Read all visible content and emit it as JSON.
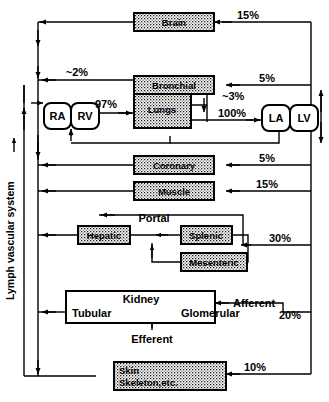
{
  "figure": {
    "type": "diagram",
    "side_axis_label": "Lymph vascular system"
  },
  "chambers": [
    {
      "id": "ra",
      "label": "RA",
      "name": "right-atrium"
    },
    {
      "id": "rv",
      "label": "RV",
      "name": "right-ventricle"
    },
    {
      "id": "la",
      "label": "LA",
      "name": "left-atrium"
    },
    {
      "id": "lv",
      "label": "LV",
      "name": "left-ventricle"
    }
  ],
  "organs": [
    {
      "id": "brain",
      "label": "Brain",
      "fill": "stipple"
    },
    {
      "id": "bronchial",
      "label": "Bronchial",
      "fill": "stipple"
    },
    {
      "id": "lungs",
      "label": "Lungs",
      "fill": "stipple"
    },
    {
      "id": "coronary",
      "label": "Coronary",
      "fill": "stipple"
    },
    {
      "id": "muscle",
      "label": "Muscle",
      "fill": "stipple"
    },
    {
      "id": "hepatic",
      "label": "Hepatic",
      "fill": "stipple"
    },
    {
      "id": "splenic",
      "label": "Splenic",
      "fill": "stipple"
    },
    {
      "id": "mesenteric",
      "label": "Mesenteric",
      "fill": "stipple"
    },
    {
      "id": "kidney",
      "label": "Kidney",
      "fill": "white"
    },
    {
      "id": "skin",
      "label_line1": "Skin",
      "label_line2": "Skeleton,etc.",
      "fill": "stipple"
    }
  ],
  "kidney_parts": {
    "title": "Kidney",
    "tubular": "Tubular",
    "glomerular": "Glomerular",
    "efferent": "Efferent",
    "afferent": "Afferent"
  },
  "portal_label": "Portal",
  "flow_labels": {
    "brain": "15%",
    "bronchial_in": "5%",
    "bronchial_shunt": "~2%",
    "lung_shunt": "~3%",
    "rv_to_lungs": "97%",
    "lv_output": "100%",
    "coronary": "5%",
    "muscle": "15%",
    "splanchnic": "30%",
    "renal": "20%",
    "skin": "10%"
  },
  "colors": {
    "line": "#000000",
    "background": "#ffffff",
    "stipple_fg": "#111111",
    "stipple_bg": "#ffffff"
  }
}
